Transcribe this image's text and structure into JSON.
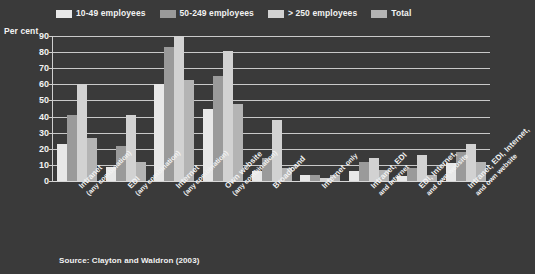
{
  "axis_title": "Per cent",
  "source_note": "Source: Clayton and Waldron (2003)",
  "colors": {
    "background": "#3a3a3a",
    "grid": "#c9c9c9",
    "text": "#f2f2f2",
    "series_10_49": "#e8e8e8",
    "series_50_249": "#9a9a9a",
    "series_250_plus": "#d2d2d2",
    "series_total": "#b4b4b4"
  },
  "legend": {
    "items": [
      {
        "label": "10-49 employees",
        "color": "#e8e8e8"
      },
      {
        "label": "50-249 employees",
        "color": "#9a9a9a"
      },
      {
        "label": "> 250 employees",
        "color": "#d2d2d2"
      },
      {
        "label": "Total",
        "color": "#b4b4b4"
      }
    ]
  },
  "chart_data": {
    "type": "bar",
    "title": "",
    "subtitle": "",
    "xlabel": "",
    "ylabel": "Per cent",
    "ylim": [
      0,
      90
    ],
    "yticks": [
      0,
      10,
      20,
      30,
      40,
      50,
      60,
      70,
      80,
      90
    ],
    "grid": true,
    "legend_position": "top",
    "categories": [
      "Intranet",
      "EDI",
      "Internet",
      "Own website",
      "Broadband",
      "Internet",
      "Intranet, EDI",
      "EDI, Internet,",
      "Intranet, EDI, Internet,"
    ],
    "category_sublabels": [
      "(any combination)",
      "(any combination)",
      "(any combination)",
      "(any combination)",
      "",
      "only",
      "and Internet",
      "and own website",
      "and own website"
    ],
    "series": [
      {
        "name": "10-49 employees",
        "values": [
          23,
          9,
          60,
          45,
          6,
          4,
          6,
          3,
          11
        ]
      },
      {
        "name": "50-249 employees",
        "values": [
          41,
          22,
          83,
          65,
          14,
          4,
          12,
          8,
          18
        ]
      },
      {
        "name": "> 250 employees",
        "values": [
          60,
          41,
          90,
          81,
          38,
          2,
          14,
          16,
          23
        ]
      },
      {
        "name": "Total",
        "values": [
          27,
          12,
          63,
          48,
          8,
          4,
          7,
          4,
          12
        ]
      }
    ]
  }
}
